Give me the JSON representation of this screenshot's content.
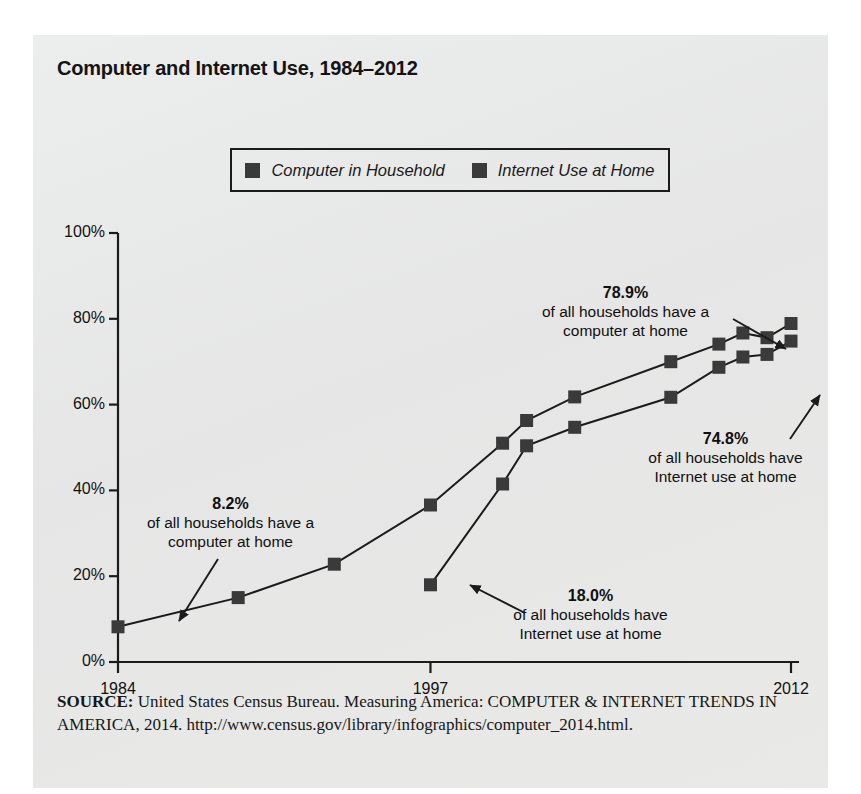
{
  "figure": {
    "title": "Computer and Internet Use, 1984–2012",
    "source_lead": "SOURCE:",
    "source_text": " United States Census Bureau. Measuring America: COMPUTER & INTERNET TRENDS IN AMERICA, 2014. http://www.census.gov/library/infographics/computer_2014.html.",
    "panel_color": "#e8e8e8",
    "ink_color": "#1b1b1b",
    "marker_color": "#3a3a3a"
  },
  "legend": {
    "items": [
      {
        "label": "Computer in Household",
        "color": "#3a3a3a"
      },
      {
        "label": "Internet Use at Home",
        "color": "#3a3a3a"
      }
    ]
  },
  "annotations": [
    {
      "id": "computer-start",
      "pct": "8.2%",
      "line1": "of all households have a",
      "line2": "computer at home",
      "value": 8.2
    },
    {
      "id": "internet-start",
      "pct": "18.0%",
      "line1": "of all households have",
      "line2": "Internet use at home",
      "value": 18.0
    },
    {
      "id": "computer-end",
      "pct": "78.9%",
      "line1": "of all households have a",
      "line2": "computer at home",
      "value": 78.9
    },
    {
      "id": "internet-end",
      "pct": "74.8%",
      "line1": "of all households have",
      "line2": "Internet use at home",
      "value": 74.8
    }
  ],
  "chart_data": {
    "type": "line",
    "title": "Computer and Internet Use, 1984–2012",
    "xlabel": "",
    "ylabel": "",
    "xlim": [
      1984,
      2012
    ],
    "ylim": [
      0,
      100
    ],
    "grid": false,
    "legend_position": "top-center",
    "x_tick_labels": [
      "1984",
      "1997",
      "2012"
    ],
    "x_ticks": [
      1984,
      1997,
      2012
    ],
    "y_tick_labels": [
      "0%",
      "20%",
      "40%",
      "60%",
      "80%",
      "100%"
    ],
    "y_ticks": [
      0,
      20,
      40,
      60,
      80,
      100
    ],
    "series": [
      {
        "name": "Computer in Household",
        "color": "#3a3a3a",
        "x": [
          1984,
          1989,
          1993,
          1997,
          2000,
          2001,
          2003,
          2007,
          2009,
          2010,
          2011,
          2012
        ],
        "values": [
          8.2,
          15.0,
          22.8,
          36.6,
          51.0,
          56.3,
          61.8,
          70.0,
          74.1,
          76.7,
          75.6,
          78.9
        ]
      },
      {
        "name": "Internet Use at Home",
        "color": "#3a3a3a",
        "x": [
          1997,
          2000,
          2001,
          2003,
          2007,
          2009,
          2010,
          2011,
          2012
        ],
        "values": [
          18.0,
          41.5,
          50.4,
          54.7,
          61.7,
          68.7,
          71.1,
          71.7,
          74.8
        ]
      }
    ]
  }
}
